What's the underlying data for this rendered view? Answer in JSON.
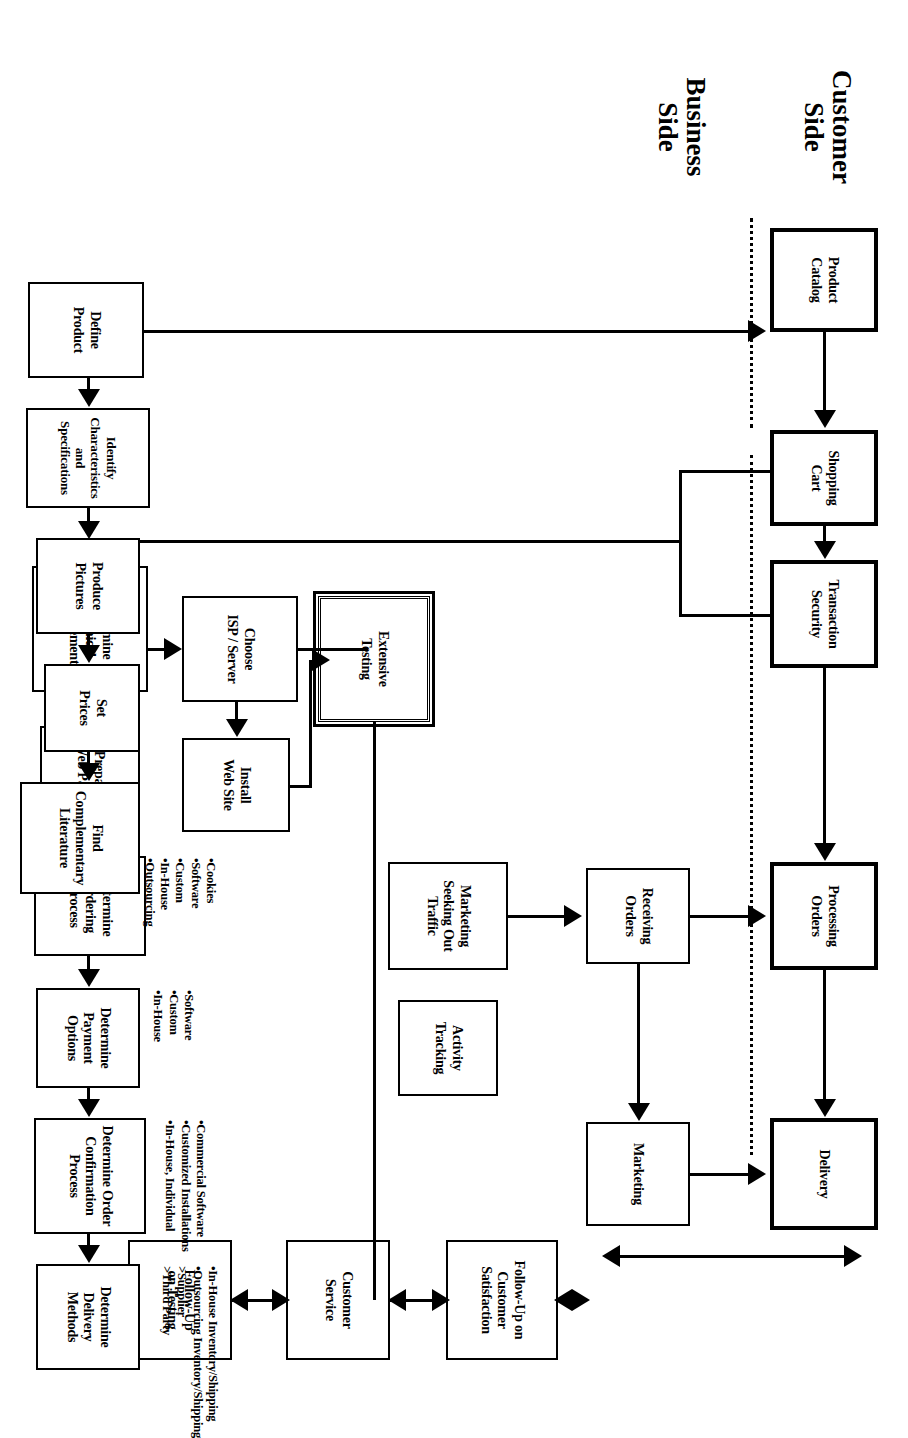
{
  "diagram": {
    "orientation": "rotated-90",
    "lanes": [
      {
        "id": "customer",
        "label": "Customer\nSide"
      },
      {
        "id": "business",
        "label": "Business\nSide"
      }
    ],
    "lane_labels": {
      "customer_line1": "Customer",
      "customer_line2": "Side",
      "business_line1": "Business",
      "business_line2": "Side"
    },
    "boxes": [
      {
        "id": "product-catalog",
        "label": "Product\nCatalog",
        "lane": "customer",
        "style": "thick"
      },
      {
        "id": "shopping-cart",
        "label": "Shopping\nCart",
        "lane": "customer",
        "style": "thick"
      },
      {
        "id": "transaction-security",
        "label": "Transaction\nSecurity",
        "lane": "customer",
        "style": "thick"
      },
      {
        "id": "processing-orders",
        "label": "Processing\nOrders",
        "lane": "customer",
        "style": "thick"
      },
      {
        "id": "delivery",
        "label": "Delivery",
        "lane": "customer",
        "style": "thick"
      },
      {
        "id": "define-product",
        "label": "Define\nProduct",
        "lane": "business",
        "style": "normal"
      },
      {
        "id": "identify-characteristics",
        "label": "Identify\nCharacteristics\nand\nSpecifications",
        "lane": "business",
        "style": "normal"
      },
      {
        "id": "produce-pictures",
        "label": "Produce\nPictures",
        "lane": "business",
        "style": "normal"
      },
      {
        "id": "set-prices",
        "label": "Set\nPrices",
        "lane": "business",
        "style": "normal"
      },
      {
        "id": "find-complementary-literature",
        "label": "Find\nComplementary\nLiterature",
        "lane": "business",
        "style": "normal"
      },
      {
        "id": "determine-technical-requirements",
        "label": "Determine\nTechnical\nRequirements",
        "lane": "business",
        "style": "normal"
      },
      {
        "id": "prepare-web-pages",
        "label": "Prepare\nWeb Pages",
        "lane": "business",
        "style": "normal"
      },
      {
        "id": "determine-ordering-process",
        "label": "Determine\nOrdering\nProcess",
        "lane": "business",
        "style": "normal"
      },
      {
        "id": "determine-payment-options",
        "label": "Determine\nPayment Options",
        "lane": "business",
        "style": "normal"
      },
      {
        "id": "determine-order-confirmation",
        "label": "Determine Order\nConfirmation\nProcess",
        "lane": "business",
        "style": "normal"
      },
      {
        "id": "determine-delivery-methods",
        "label": "Determine\nDelivery Methods",
        "lane": "business",
        "style": "normal"
      },
      {
        "id": "choose-isp-server",
        "label": "Choose\nISP / Server",
        "lane": "business",
        "style": "normal"
      },
      {
        "id": "install-web-site",
        "label": "Install\nWeb Site",
        "lane": "business",
        "style": "normal"
      },
      {
        "id": "marketing-seeking-traffic",
        "label": "Marketing\nSeeking Out\nTraffic",
        "lane": "business",
        "style": "normal"
      },
      {
        "id": "activity-tracking",
        "label": "Activity\nTracking",
        "lane": "business",
        "style": "normal"
      },
      {
        "id": "extensive-testing",
        "label": "Extensive\nTesting",
        "lane": "business",
        "style": "double"
      },
      {
        "id": "receiving-orders",
        "label": "Receiving\nOrders",
        "lane": "business",
        "style": "normal"
      },
      {
        "id": "marketing",
        "label": "Marketing",
        "lane": "business",
        "style": "normal"
      },
      {
        "id": "follow-up-customer-satisfaction",
        "label": "Follow-Up on\nCustomer\nSatisfaction",
        "lane": "business",
        "style": "normal"
      },
      {
        "id": "customer-service",
        "label": "Customer\nService",
        "lane": "business",
        "style": "normal"
      },
      {
        "id": "follow-up-on-testing",
        "label": "Follow-Up\non Testing",
        "lane": "business",
        "style": "normal"
      }
    ],
    "annotations": [
      {
        "id": "ordering-process-options",
        "attached_to": "determine-ordering-process",
        "items": [
          "•Cookies",
          "•Software",
          "•Custom",
          "•In-House",
          "•Outsourcing"
        ]
      },
      {
        "id": "payment-options-list",
        "attached_to": "determine-payment-options",
        "items": [
          "•Software",
          "•Custom",
          "•In-House"
        ]
      },
      {
        "id": "order-confirmation-options",
        "attached_to": "determine-order-confirmation",
        "items": [
          "•Commercial Software",
          "•Customized Installations",
          "•In-House, Individual"
        ]
      },
      {
        "id": "delivery-methods-options",
        "attached_to": "determine-delivery-methods",
        "items": [
          "•In-House Inventory/Shipping",
          "•Outsourcing Inventory/Shipping",
          ">Supplier",
          ">Third Party"
        ]
      }
    ],
    "connections": [
      {
        "from": "product-catalog",
        "to": "shopping-cart",
        "type": "single"
      },
      {
        "from": "shopping-cart",
        "to": "transaction-security",
        "type": "single"
      },
      {
        "from": "transaction-security",
        "to": "processing-orders",
        "type": "single"
      },
      {
        "from": "processing-orders",
        "to": "delivery",
        "type": "single"
      },
      {
        "from": "product-catalog",
        "to": "define-product",
        "type": "single"
      },
      {
        "from": "define-product",
        "to": "identify-characteristics",
        "type": "single"
      },
      {
        "from": "identify-characteristics",
        "to": "produce-pictures",
        "type": "single"
      },
      {
        "from": "produce-pictures",
        "to": "set-prices",
        "type": "single"
      },
      {
        "from": "set-prices",
        "to": "find-complementary-literature",
        "type": "single"
      },
      {
        "from": "define-product",
        "to": "determine-technical-requirements",
        "type": "single"
      },
      {
        "from": "shopping-cart",
        "to": "determine-technical-requirements",
        "type": "single"
      },
      {
        "from": "transaction-security",
        "to": "determine-technical-requirements",
        "type": "single"
      },
      {
        "from": "determine-technical-requirements",
        "to": "prepare-web-pages",
        "type": "single"
      },
      {
        "from": "prepare-web-pages",
        "to": "determine-ordering-process",
        "type": "single"
      },
      {
        "from": "determine-ordering-process",
        "to": "determine-payment-options",
        "type": "single"
      },
      {
        "from": "determine-payment-options",
        "to": "determine-order-confirmation",
        "type": "single"
      },
      {
        "from": "determine-order-confirmation",
        "to": "determine-delivery-methods",
        "type": "single"
      },
      {
        "from": "determine-technical-requirements",
        "to": "choose-isp-server",
        "type": "single"
      },
      {
        "from": "choose-isp-server",
        "to": "install-web-site",
        "type": "single"
      },
      {
        "from": "choose-isp-server",
        "to": "marketing-seeking-traffic",
        "type": "single"
      },
      {
        "from": "marketing-seeking-traffic",
        "to": "receiving-orders",
        "type": "single"
      },
      {
        "from": "receiving-orders",
        "to": "processing-orders",
        "type": "single"
      },
      {
        "from": "receiving-orders",
        "to": "marketing",
        "type": "single"
      },
      {
        "from": "install-web-site",
        "to": "extensive-testing",
        "type": "single"
      },
      {
        "from": "extensive-testing",
        "to": "follow-up-on-testing",
        "type": "single"
      },
      {
        "from": "delivery",
        "to": "marketing",
        "type": "double"
      },
      {
        "from": "marketing",
        "to": "follow-up-customer-satisfaction",
        "type": "double"
      },
      {
        "from": "follow-up-customer-satisfaction",
        "to": "customer-service",
        "type": "double"
      },
      {
        "from": "customer-service",
        "to": "follow-up-on-testing",
        "type": "double"
      }
    ],
    "colors": {
      "ink": "#000000",
      "paper": "#ffffff"
    }
  }
}
